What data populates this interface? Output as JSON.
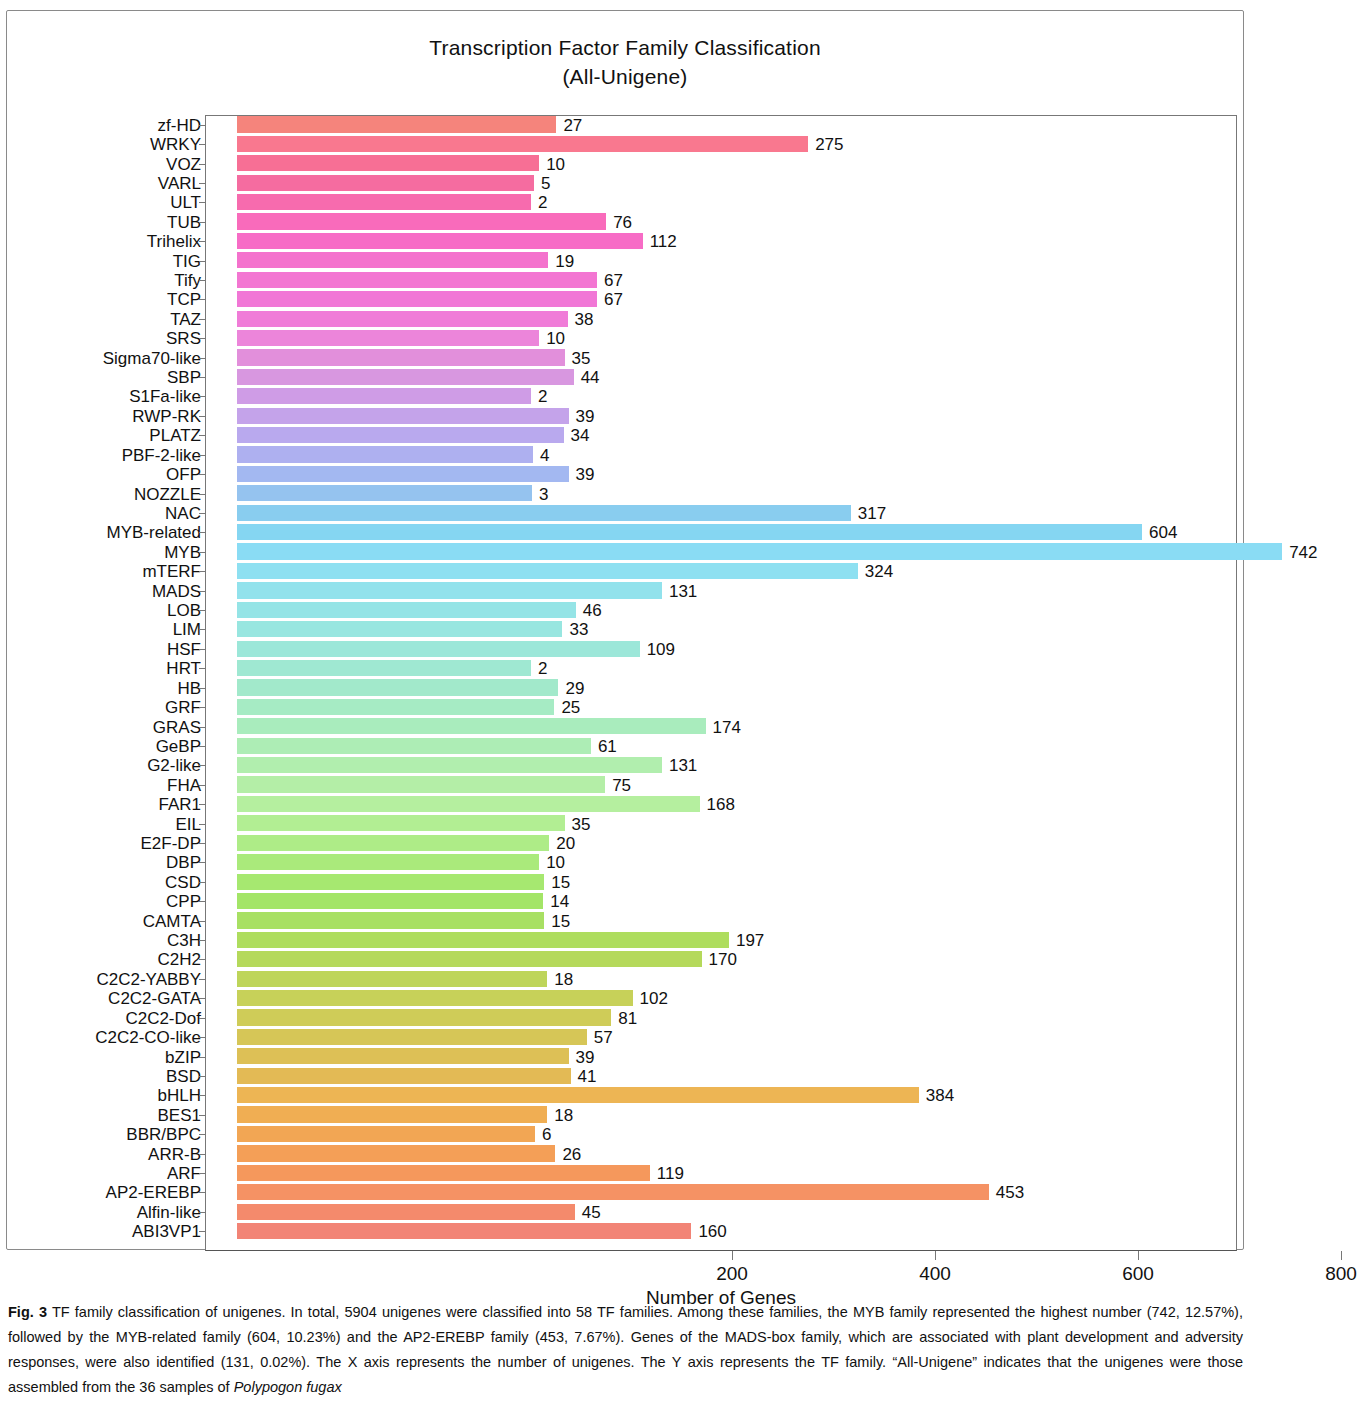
{
  "figure": {
    "title_line1": "Transcription Factor Family Classification",
    "title_line2": "(All-Unigene)",
    "caption_label": "Fig. 3",
    "caption_text": " TF family classification of unigenes. In total, 5904 unigenes were classified into 58 TF families. Among these families, the MYB family represented the highest number (742, 12.57%), followed by the MYB-related family (604, 10.23%) and the AP2-EREBP family (453, 7.67%). Genes of the MADS-box family, which are associated with plant development and adversity responses, were also identified (131, 0.02%). The X axis represents the number of unigenes. The Y axis represents the TF family. “All-Unigene” indicates that the unigenes were those assembled from the 36 samples of ",
    "caption_italic": "Polypogon fugax"
  },
  "chart_data": {
    "type": "bar",
    "orientation": "horizontal",
    "title": "Transcription Factor Family Classification (All-Unigene)",
    "xlabel": "Number of Genes",
    "ylabel": "",
    "xlim": [
      0,
      800
    ],
    "xticks": [
      200,
      400,
      600,
      800
    ],
    "grid": false,
    "legend": null,
    "total_unigenes": 5904,
    "total_families": 58,
    "categories": [
      "zf-HD",
      "WRKY",
      "VOZ",
      "VARL",
      "ULT",
      "TUB",
      "Trihelix",
      "TIG",
      "Tify",
      "TCP",
      "TAZ",
      "SRS",
      "Sigma70-like",
      "SBP",
      "S1Fa-like",
      "RWP-RK",
      "PLATZ",
      "PBF-2-like",
      "OFP",
      "NOZZLE",
      "NAC",
      "MYB-related",
      "MYB",
      "mTERF",
      "MADS",
      "LOB",
      "LIM",
      "HSF",
      "HRT",
      "HB",
      "GRF",
      "GRAS",
      "GeBP",
      "G2-like",
      "FHA",
      "FAR1",
      "EIL",
      "E2F-DP",
      "DBP",
      "CSD",
      "CPP",
      "CAMTA",
      "C3H",
      "C2H2",
      "C2C2-YABBY",
      "C2C2-GATA",
      "C2C2-Dof",
      "C2C2-CO-like",
      "bZIP",
      "BSD",
      "bHLH",
      "BES1",
      "BBR/BPC",
      "ARR-B",
      "ARF",
      "AP2-EREBP",
      "Alfin-like",
      "ABI3VP1"
    ],
    "values": [
      27,
      275,
      10,
      5,
      2,
      76,
      112,
      19,
      67,
      67,
      38,
      10,
      35,
      44,
      2,
      39,
      34,
      4,
      39,
      3,
      317,
      604,
      742,
      324,
      131,
      46,
      33,
      109,
      2,
      29,
      25,
      174,
      61,
      131,
      75,
      168,
      35,
      20,
      10,
      15,
      14,
      15,
      197,
      170,
      18,
      102,
      81,
      57,
      39,
      41,
      384,
      18,
      6,
      26,
      119,
      453,
      45,
      160
    ],
    "bar_colors": [
      "#f5847c",
      "#f9788f",
      "#f76f95",
      "#f56ca0",
      "#f76bae",
      "#f96bbb",
      "#f76cc6",
      "#f472cd",
      "#f376d2",
      "#f177d6",
      "#f07cd8",
      "#ec85da",
      "#e28fdb",
      "#d897e0",
      "#cf9ce6",
      "#c4a3ea",
      "#b9a9ee",
      "#aeb0f0",
      "#a3b8f1",
      "#95c3ef",
      "#89cdef",
      "#85d6f2",
      "#8adcf4",
      "#8ee0f1",
      "#92e2ec",
      "#95e4e6",
      "#98e6e0",
      "#9ce7d9",
      "#9fe8d2",
      "#a2e9cb",
      "#a6ebc4",
      "#a9ecbd",
      "#adedb5",
      "#b1eeae",
      "#b4eea7",
      "#b5ef9f",
      "#b2ee93",
      "#aeec87",
      "#aaea7b",
      "#a6e870",
      "#a3e567",
      "#a8e063",
      "#aedd5e",
      "#b5d95b",
      "#bed55a",
      "#c7d159",
      "#cfcc58",
      "#d6c657",
      "#ddc056",
      "#e3ba55",
      "#edb554",
      "#f0ae53",
      "#f2a654",
      "#f49f57",
      "#f5985c",
      "#f59264",
      "#f48a6c",
      "#f28476"
    ]
  }
}
